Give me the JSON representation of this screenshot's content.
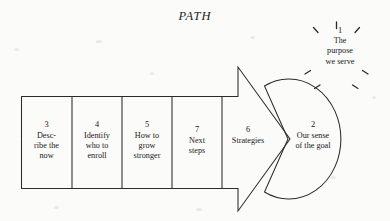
{
  "title": "PATH",
  "colors": {
    "ink": "#1a1a1a",
    "paper": "#fbfbfa",
    "stroke": "#2b2b2b"
  },
  "diagram": {
    "type": "process-flow",
    "shape_notes": "Left-to-right banded arrow pointing right into a circle; a starburst above the circle.",
    "burst": {
      "number": "1",
      "text": "The\npurpose\nwe serve",
      "ray_count": 6
    },
    "circle": {
      "number": "2",
      "text": "Our sense\nof the goal"
    },
    "arrow_head": {
      "number": "6",
      "text": "Strategies"
    },
    "boxes": [
      {
        "number": "3",
        "text": "Desc-\nribe the\nnow"
      },
      {
        "number": "4",
        "text": "Identify\nwho to\nenroll"
      },
      {
        "number": "5",
        "text": "How to\ngrow\nstronger"
      },
      {
        "number": "7",
        "text": "Next\nsteps"
      }
    ]
  }
}
